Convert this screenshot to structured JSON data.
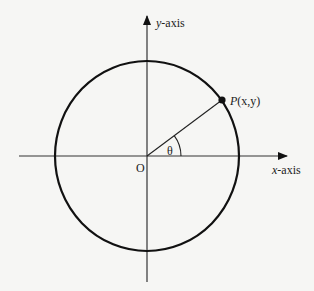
{
  "diagram": {
    "labels": {
      "y_axis": "y-axis",
      "y_axis_var": "y",
      "y_axis_suffix": "-axis",
      "x_axis_var": "x",
      "x_axis_suffix": "-axis",
      "origin": "O",
      "point": "P(x,y)",
      "point_P": "P",
      "point_coords": "(x,y)",
      "angle": "θ"
    },
    "geometry": {
      "origin": [
        147,
        156
      ],
      "radius": 93,
      "angle_deg": 37,
      "point": [
        222,
        100
      ]
    },
    "colors": {
      "background": "#f6f6f4",
      "stroke": "#111111"
    }
  }
}
